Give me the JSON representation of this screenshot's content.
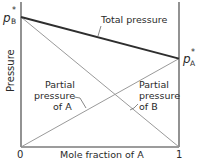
{
  "chart_data": {
    "type": "line",
    "title": "",
    "xlabel": "Mole fraction of A",
    "ylabel": "Pressure",
    "xlim": [
      0,
      1
    ],
    "x_tick_labels": [
      "0",
      "1"
    ],
    "y_tick_labels": [
      "p*B",
      "p*A"
    ],
    "pB_star": 1.0,
    "pA_star": 0.68,
    "series": [
      {
        "name": "Total pressure",
        "x": [
          0,
          1
        ],
        "values": [
          1.0,
          0.68
        ]
      },
      {
        "name": "Partial pressure of A",
        "x": [
          0,
          1
        ],
        "values": [
          0,
          0.68
        ]
      },
      {
        "name": "Partial pressure of B",
        "x": [
          0,
          1
        ],
        "values": [
          1.0,
          0
        ]
      }
    ],
    "annotations": [
      {
        "text": "Total pressure",
        "target": "Total pressure"
      },
      {
        "lines": [
          "Partial",
          "pressure",
          "of A"
        ],
        "target": "Partial pressure of A"
      },
      {
        "lines": [
          "Partial",
          "pressure",
          "of B"
        ],
        "target": "Partial pressure of B"
      }
    ]
  },
  "labels": {
    "pB_p": "p",
    "pB_star": "*",
    "pB_sub": "B",
    "pA_p": "p",
    "pA_star": "*",
    "pA_sub": "A",
    "y_axis": "Pressure",
    "x_axis": "Mole fraction of A",
    "x0": "0",
    "x1": "1",
    "total": "Total pressure",
    "partialA": [
      "Partial",
      "pressure",
      "of A"
    ],
    "partialB": [
      "Partial",
      "pressure",
      "of B"
    ]
  }
}
